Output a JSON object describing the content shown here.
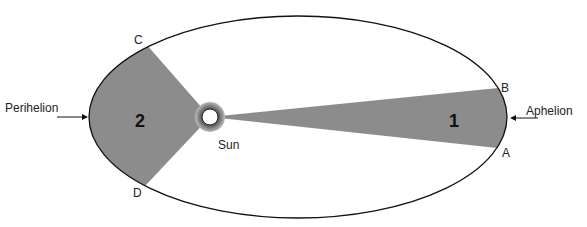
{
  "diagram": {
    "labels": {
      "perihelion": "Perihelion",
      "aphelion": "Aphelion",
      "sun": "Sun",
      "point_a": "A",
      "point_b": "B",
      "point_c": "C",
      "point_d": "D",
      "area_1": "1",
      "area_2": "2"
    },
    "colors": {
      "sector_fill": "#8c8c8c",
      "orbit_stroke": "#111111",
      "background": "#ffffff"
    }
  }
}
